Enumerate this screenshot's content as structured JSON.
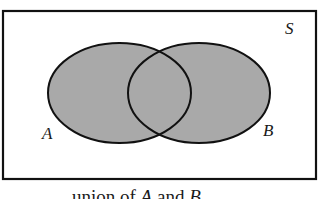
{
  "diagram": {
    "type": "venn",
    "universe_label": "S",
    "sets": [
      {
        "label": "A",
        "shaded": true
      },
      {
        "label": "B",
        "shaded": true
      }
    ],
    "shaded_region": "A ∪ B",
    "colors": {
      "fill": "#a9a9a9",
      "stroke": "#111111",
      "background": "#ffffff"
    },
    "caption": {
      "prefix": "union of ",
      "set1": "A",
      "middle": " and ",
      "set2": "B"
    }
  }
}
